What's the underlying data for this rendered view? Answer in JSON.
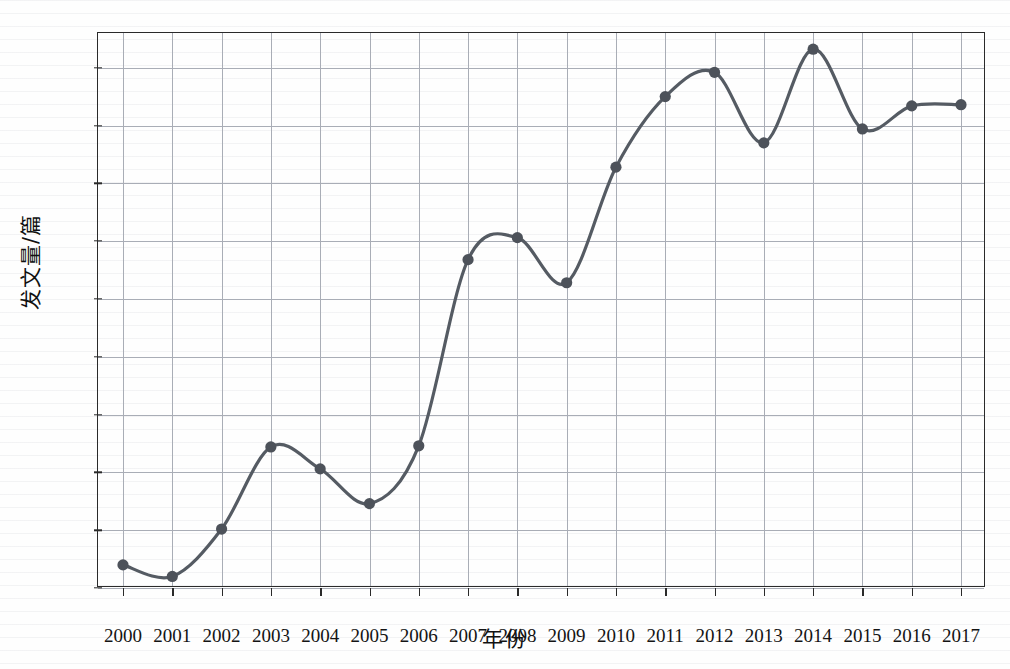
{
  "figure": {
    "clipped_top_text": "图1 中国知网相关文献年度发文量",
    "background_color": "#fefefe"
  },
  "axes": {
    "ylabel": "发文量/篇",
    "xlabel": "年份",
    "y_ticks": [
      0,
      5,
      10,
      15,
      20,
      25,
      30,
      35,
      40,
      45
    ],
    "x_ticks": [
      "2000",
      "2001",
      "2002",
      "2003",
      "2004",
      "2005",
      "2006",
      "2007",
      "2008",
      "2009",
      "2010",
      "2011",
      "2012",
      "2013",
      "2014",
      "2015",
      "2016",
      "2017"
    ],
    "ylim": [
      0,
      48
    ],
    "xlim": [
      2000,
      2017
    ]
  },
  "style": {
    "line_color": "#555b63",
    "marker_color": "#4d525a",
    "grid_color": "#a9adb6",
    "frame_color": "#2a2a2a",
    "text_color": "#141414"
  },
  "chart_data": {
    "type": "line",
    "title": "",
    "xlabel": "年份",
    "ylabel": "发文量/篇",
    "x": [
      2000,
      2001,
      2002,
      2003,
      2004,
      2005,
      2006,
      2007,
      2008,
      2009,
      2010,
      2011,
      2012,
      2013,
      2014,
      2015,
      2016,
      2017
    ],
    "categories": [
      "2000",
      "2001",
      "2002",
      "2003",
      "2004",
      "2005",
      "2006",
      "2007",
      "2008",
      "2009",
      "2010",
      "2011",
      "2012",
      "2013",
      "2014",
      "2015",
      "2016",
      "2017"
    ],
    "values": [
      2.0,
      1.0,
      5.1,
      12.2,
      10.3,
      7.3,
      12.3,
      28.4,
      30.3,
      26.4,
      36.4,
      42.5,
      44.6,
      38.5,
      46.6,
      39.7,
      41.7,
      41.8
    ],
    "series": [
      {
        "name": "发文量",
        "values": [
          2.0,
          1.0,
          5.1,
          12.2,
          10.3,
          7.3,
          12.3,
          28.4,
          30.3,
          26.4,
          36.4,
          42.5,
          44.6,
          38.5,
          46.6,
          39.7,
          41.7,
          41.8
        ]
      }
    ],
    "ylim": [
      0,
      48
    ],
    "xlim": [
      2000,
      2017
    ],
    "grid": true,
    "legend": false,
    "markers": "circle",
    "smoothing": "spline"
  }
}
